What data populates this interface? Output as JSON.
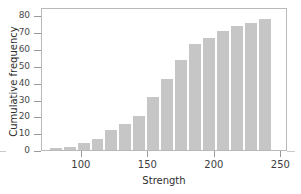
{
  "chart_data": {
    "type": "bar",
    "title": "",
    "subtitle": "",
    "xlabel": "Strength",
    "ylabel": "Cumulative frequency",
    "xlim": [
      70,
      255
    ],
    "ylim": [
      0,
      85
    ],
    "xticks": [
      100,
      150,
      200,
      250
    ],
    "yticks": [
      0,
      10,
      20,
      30,
      40,
      50,
      60,
      70,
      80
    ],
    "grid": false,
    "legend": null,
    "bar_color": "#c6c6c6",
    "bar_edge_color": "#ffffff",
    "frame_color": "#b9b9b9",
    "bin_width": 10.5,
    "categories": [
      "75-85.5",
      "85.5-96",
      "96-106.5",
      "106.5-117",
      "117-127.5",
      "127.5-138",
      "138-148.5",
      "148.5-159",
      "159-169.5",
      "169.5-180",
      "180-190.5",
      "190.5-201",
      "201-211.5",
      "211.5-222",
      "222-232.5",
      "232.5-243"
    ],
    "bin_centers": [
      80.25,
      90.75,
      101.25,
      111.75,
      122.25,
      132.75,
      143.25,
      153.75,
      164.25,
      174.75,
      185.25,
      195.75,
      206.25,
      216.75,
      227.25,
      237.75
    ],
    "bin_left_edges": [
      75,
      85.5,
      96,
      106.5,
      117,
      127.5,
      138,
      148.5,
      159,
      169.5,
      180,
      190.5,
      201,
      211.5,
      222,
      232.5
    ],
    "values": [
      1,
      2,
      4,
      6.5,
      12,
      15.5,
      20,
      31.5,
      42.5,
      53.5,
      63,
      66.5,
      71,
      73.5,
      75.5,
      78
    ],
    "series": [
      {
        "name": "Cumulative frequency",
        "values": [
          1,
          2,
          4,
          6.5,
          12,
          15.5,
          20,
          31.5,
          42.5,
          53.5,
          63,
          66.5,
          71,
          73.5,
          75.5,
          78
        ]
      }
    ]
  },
  "axes": {
    "ytick_labels": [
      "80",
      "70",
      "60",
      "50",
      "40",
      "30",
      "20",
      "10",
      "0"
    ],
    "xtick_labels": [
      "100",
      "150",
      "200",
      "250"
    ],
    "xlabel": "Strength",
    "ylabel": "Cumulative frequency"
  }
}
